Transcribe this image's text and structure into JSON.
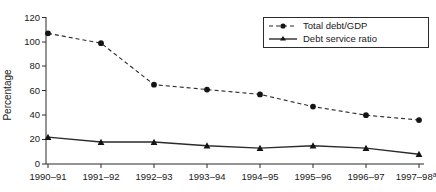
{
  "chart_data": {
    "type": "line",
    "title": "",
    "xlabel": "",
    "ylabel": "Percentage",
    "ylim": [
      0,
      120
    ],
    "yticks": [
      0,
      20,
      40,
      60,
      80,
      100,
      120
    ],
    "grid": false,
    "legend_position": "top-right",
    "categories": [
      "1990–91",
      "1991–92",
      "1992–93",
      "1993–94",
      "1994–95",
      "1995–96",
      "1996–97",
      "1997–98"
    ],
    "category_note": "a",
    "category_note_index": 7,
    "series": [
      {
        "name": "Total debt/GDP",
        "style": "dashed",
        "marker": "circle",
        "values": [
          107,
          99,
          65,
          61,
          57,
          47,
          40,
          36
        ]
      },
      {
        "name": "Debt service ratio",
        "style": "solid",
        "marker": "triangle",
        "values": [
          22,
          18,
          18,
          15,
          13,
          15,
          13,
          8
        ]
      }
    ]
  },
  "axis": {
    "y_label": "Percentage",
    "y_tick_labels": [
      "0",
      "20",
      "40",
      "60",
      "80",
      "100",
      "120"
    ],
    "x_tick_labels": [
      "1990–91",
      "1991–92",
      "1992–93",
      "1993–94",
      "1994–95",
      "1995–96",
      "1996–97",
      "1997–98"
    ],
    "x_last_superscript": "a"
  },
  "legend": {
    "items": [
      {
        "label": "Total debt/GDP",
        "marker": "circle-marker-icon",
        "line": "dashed"
      },
      {
        "label": "Debt service ratio",
        "marker": "triangle-marker-icon",
        "line": "solid"
      }
    ]
  },
  "colors": {
    "ink": "#2b2b2b",
    "marker": "#141414",
    "background": "#ffffff"
  }
}
